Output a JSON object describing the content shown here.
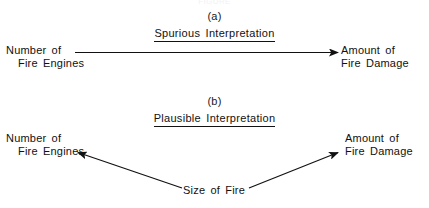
{
  "figure": {
    "top_caption": "FIGURE",
    "background_color": "#ffffff",
    "ink_color": "#111111"
  },
  "panels": [
    {
      "id": "panel-a",
      "letter": "(a)",
      "title": "Spurious Interpretation",
      "left_node": {
        "line1": "Number of",
        "line2": "Fire Engines"
      },
      "right_node": {
        "line1": "Amount of",
        "line2": "Fire Damage"
      },
      "arrows": [
        {
          "name": "arrow-engines-to-damage",
          "from": "Number of Fire Engines",
          "to": "Amount of Fire Damage",
          "direction": "right"
        }
      ]
    },
    {
      "id": "panel-b",
      "letter": "(b)",
      "title": "Plausible Interpretation",
      "left_node": {
        "line1": "Number of",
        "line2": "Fire Engines"
      },
      "right_node": {
        "line1": "Amount of",
        "line2": "Fire Damage"
      },
      "mid_node": {
        "label": "Size of Fire"
      },
      "arrows": [
        {
          "name": "arrow-size-to-engines",
          "from": "Size of Fire",
          "to": "Number of Fire Engines",
          "direction": "up-left"
        },
        {
          "name": "arrow-size-to-damage",
          "from": "Size of Fire",
          "to": "Amount of Fire Damage",
          "direction": "up-right"
        }
      ]
    }
  ]
}
